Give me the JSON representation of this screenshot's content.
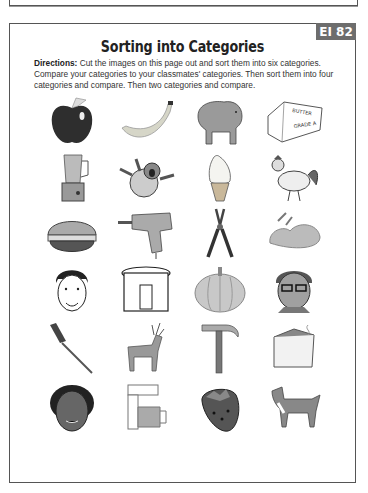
{
  "page": {
    "tab_label": "EI 82",
    "title": "Sorting into Categories",
    "directions_label": "Directions:",
    "directions_text": " Cut the images on this page out and sort them into six categories. Compare your categories to your classmates' categories. Then sort them into four categories and compare. Then two categories and compare."
  },
  "images": [
    [
      "apple",
      "banana",
      "bear",
      "butter"
    ],
    [
      "blender",
      "monkey",
      "ice-cream-cone",
      "rooster"
    ],
    [
      "hamburger",
      "drill",
      "pliers",
      "steak"
    ],
    [
      "woman-face",
      "slow-cooker",
      "pumpkin",
      "boy-with-glasses"
    ],
    [
      "screwdriver",
      "deer",
      "hammer",
      "freezer"
    ],
    [
      "boy-face",
      "coffee-maker",
      "strawberry",
      "dog"
    ]
  ],
  "butter_labels": {
    "top": "BUTTER",
    "bottom": "GRADE A"
  }
}
